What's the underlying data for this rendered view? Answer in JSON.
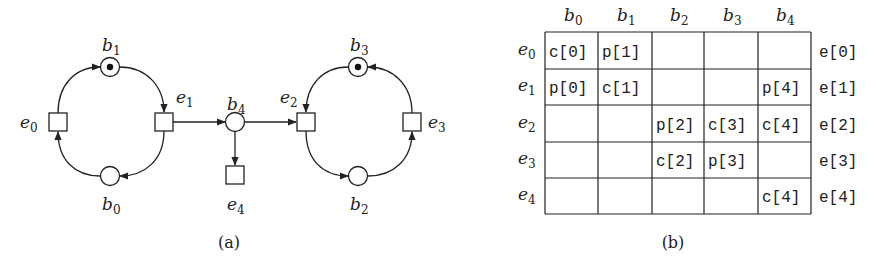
{
  "figure_a": {
    "caption": "(a)",
    "places": [
      {
        "id": "b0",
        "base": "b",
        "sub": "0",
        "marked": false
      },
      {
        "id": "b1",
        "base": "b",
        "sub": "1",
        "marked": true
      },
      {
        "id": "b2",
        "base": "b",
        "sub": "2",
        "marked": false
      },
      {
        "id": "b3",
        "base": "b",
        "sub": "3",
        "marked": true
      },
      {
        "id": "b4",
        "base": "b",
        "sub": "4",
        "marked": false
      }
    ],
    "transitions": [
      {
        "id": "e0",
        "base": "e",
        "sub": "0"
      },
      {
        "id": "e1",
        "base": "e",
        "sub": "1"
      },
      {
        "id": "e2",
        "base": "e",
        "sub": "2"
      },
      {
        "id": "e3",
        "base": "e",
        "sub": "3"
      },
      {
        "id": "e4",
        "base": "e",
        "sub": "4"
      }
    ],
    "arcs": [
      [
        "e0",
        "b1"
      ],
      [
        "b1",
        "e1"
      ],
      [
        "e1",
        "b0"
      ],
      [
        "b0",
        "e0"
      ],
      [
        "e1",
        "b4"
      ],
      [
        "b4",
        "e2"
      ],
      [
        "b4",
        "e4"
      ],
      [
        "b3",
        "e2"
      ],
      [
        "e2",
        "b2"
      ],
      [
        "b2",
        "e3"
      ],
      [
        "e3",
        "b3"
      ]
    ]
  },
  "figure_b": {
    "caption": "(b)",
    "column_headers": [
      {
        "base": "b",
        "sub": "0"
      },
      {
        "base": "b",
        "sub": "1"
      },
      {
        "base": "b",
        "sub": "2"
      },
      {
        "base": "b",
        "sub": "3"
      },
      {
        "base": "b",
        "sub": "4"
      }
    ],
    "row_headers": [
      {
        "base": "e",
        "sub": "0"
      },
      {
        "base": "e",
        "sub": "1"
      },
      {
        "base": "e",
        "sub": "2"
      },
      {
        "base": "e",
        "sub": "3"
      },
      {
        "base": "e",
        "sub": "4"
      }
    ],
    "cells": [
      [
        "c[0]",
        "p[1]",
        "",
        "",
        ""
      ],
      [
        "p[0]",
        "c[1]",
        "",
        "",
        "p[4]"
      ],
      [
        "",
        "",
        "p[2]",
        "c[3]",
        "c[4]"
      ],
      [
        "",
        "",
        "c[2]",
        "p[3]",
        ""
      ],
      [
        "",
        "",
        "",
        "",
        "c[4]"
      ]
    ],
    "row_right_labels": [
      "e[0]",
      "e[1]",
      "e[2]",
      "e[3]",
      "e[4]"
    ]
  }
}
